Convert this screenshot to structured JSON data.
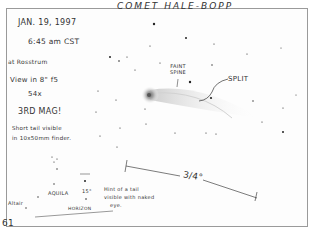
{
  "sketch": {
    "title": "COMET HALE-BOPP",
    "notes": {
      "date": "JAN. 19, 1997",
      "time": "6:45 am CST",
      "location": "at Rosstrum",
      "instrument": "View in 8\" f5",
      "magnification": "54x",
      "magnitude": "3RD MAG!",
      "tail_note_line1": "Short tail visible",
      "tail_note_line2": "in 10x50mm finder."
    },
    "annotations": {
      "faint_spine_line1": "FAINT",
      "faint_spine_line2": "SPINE",
      "split": "SPLIT",
      "scale": "3/4°",
      "finder_aquila": "AQUILA",
      "finder_altair": "Altair",
      "finder_angle": "15°",
      "finder_horizon": "HORIZON",
      "naked_eye_line1": "Hint of a tail",
      "naked_eye_line2": "visible with naked",
      "naked_eye_line3": "eye."
    },
    "page_number": "61"
  },
  "colors": {
    "ink": "#2a2a2a",
    "paper": "#fdfdfd",
    "frame": "#9a9a9a",
    "coma_glow": "#b8b8b8"
  }
}
